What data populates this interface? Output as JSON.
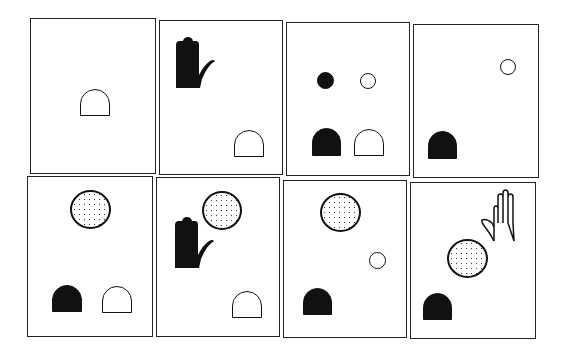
{
  "figure": {
    "layout": {
      "rows": 2,
      "cols": 4
    },
    "colors": {
      "ink": "#111111",
      "background": "#ffffff"
    },
    "panels": [
      {
        "id": 1,
        "row": 1,
        "col": 1,
        "objects": [
          "open-arch"
        ]
      },
      {
        "id": 2,
        "row": 1,
        "col": 2,
        "objects": [
          "black-hand",
          "open-arch"
        ]
      },
      {
        "id": 3,
        "row": 1,
        "col": 3,
        "objects": [
          "small-black-circle",
          "small-open-circle",
          "black-arch",
          "open-arch"
        ]
      },
      {
        "id": 4,
        "row": 1,
        "col": 4,
        "objects": [
          "small-open-circle",
          "black-arch"
        ]
      },
      {
        "id": 5,
        "row": 2,
        "col": 1,
        "objects": [
          "large-stippled-circle",
          "black-arch",
          "open-arch"
        ]
      },
      {
        "id": 6,
        "row": 2,
        "col": 2,
        "objects": [
          "large-stippled-circle",
          "black-hand",
          "open-arch"
        ]
      },
      {
        "id": 7,
        "row": 2,
        "col": 3,
        "objects": [
          "large-stippled-circle",
          "small-open-circle",
          "black-arch"
        ]
      },
      {
        "id": 8,
        "row": 2,
        "col": 4,
        "objects": [
          "outline-hand",
          "large-stippled-circle",
          "black-arch"
        ]
      }
    ]
  }
}
